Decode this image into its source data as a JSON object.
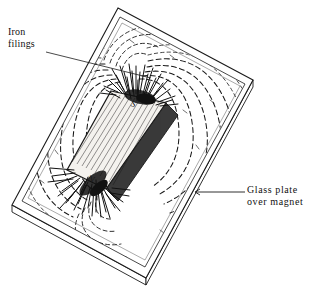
{
  "figure": {
    "background_color": "#ffffff",
    "ink_color": "#1a1a1a"
  },
  "annotations": {
    "iron_filings": {
      "line1": "Iron",
      "line2": "filings",
      "leader_from_x": 46,
      "leader_from_y": 52,
      "leader_to_x": 151,
      "leader_to_y": 78
    },
    "glass_plate": {
      "line1": "Glass plate",
      "line2": "over magnet",
      "leader_from_x": 245,
      "leader_from_y": 192,
      "leader_to_x": 196,
      "leader_to_y": 192
    }
  },
  "magnet": {
    "north_pole_label": "N",
    "south_pole_label": "S",
    "south_pole_x": 133,
    "south_pole_y": 105,
    "north_pole_x": 90,
    "north_pole_y": 180
  },
  "glass_plate_corners": {
    "top": [
      118,
      8
    ],
    "right": [
      253,
      80
    ],
    "bottom": [
      146,
      278
    ],
    "left": [
      12,
      205
    ],
    "thickness_px": 7
  }
}
